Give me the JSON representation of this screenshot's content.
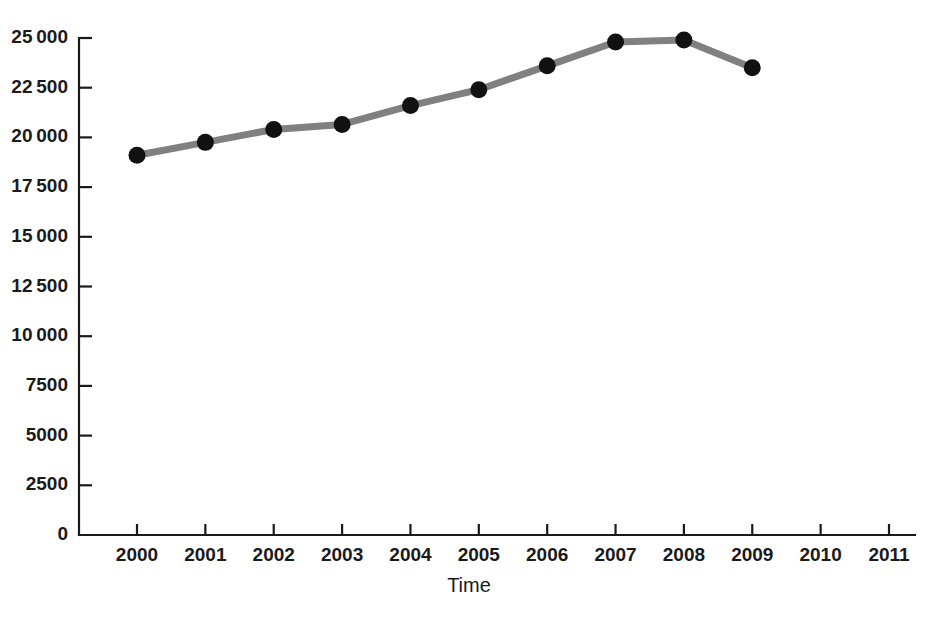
{
  "chart_data": {
    "type": "line",
    "title": "",
    "xlabel": "Time",
    "ylabel": "",
    "x": [
      2000,
      2001,
      2002,
      2003,
      2004,
      2005,
      2006,
      2007,
      2008,
      2009
    ],
    "categories": [
      "2000",
      "2001",
      "2002",
      "2003",
      "2004",
      "2005",
      "2006",
      "2007",
      "2008",
      "2009"
    ],
    "values": [
      19100,
      19750,
      20400,
      20650,
      21600,
      22400,
      23600,
      24800,
      24900,
      23500
    ],
    "series": [
      {
        "name": "",
        "values": [
          19100,
          19750,
          20400,
          20650,
          21600,
          22400,
          23600,
          24800,
          24900,
          23500
        ]
      }
    ],
    "xlim": [
      2000,
      2011
    ],
    "ylim": [
      0,
      25000
    ],
    "x_ticks": [
      2000,
      2001,
      2002,
      2003,
      2004,
      2005,
      2006,
      2007,
      2008,
      2009,
      2010,
      2011
    ],
    "x_tick_labels": [
      "2000",
      "2001",
      "2002",
      "2003",
      "2004",
      "2005",
      "2006",
      "2007",
      "2008",
      "2009",
      "2010",
      "2011"
    ],
    "y_ticks": [
      0,
      2500,
      5000,
      7500,
      10000,
      12500,
      15000,
      17500,
      20000,
      22500,
      25000
    ],
    "y_tick_labels": [
      "0",
      "2500",
      "5000",
      "7500",
      "10 000",
      "12 500",
      "15 000",
      "17 500",
      "20 000",
      "22 500",
      "25 000"
    ],
    "grid": false,
    "legend": false,
    "legend_position": "none",
    "line_color": "#808080",
    "marker_color": "#111111",
    "marker_shape": "circle",
    "axis_color": "#1a1a1a",
    "background_color": "#ffffff"
  },
  "figure": {
    "top_caption": ""
  }
}
